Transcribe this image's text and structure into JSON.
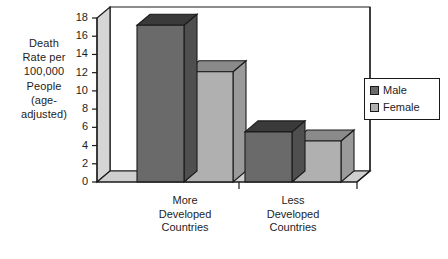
{
  "chart_data": {
    "type": "bar",
    "title": "",
    "subtitle": "",
    "xlabel": "",
    "ylabel": "Death Rate per 100,000 People (age-adjusted)",
    "ylabel_lines": [
      "Death",
      "Rate per",
      "100,000",
      "People",
      "(age-",
      "adjusted)"
    ],
    "categories": [
      "More Developed Countries",
      "Less Developed Countries"
    ],
    "category_lines": [
      [
        "More",
        "Developed",
        "Countries"
      ],
      [
        "Less",
        "Developed",
        "Countries"
      ]
    ],
    "series": [
      {
        "name": "Male",
        "values": [
          17.2,
          5.5
        ],
        "color": "#6a6a6a"
      },
      {
        "name": "Female",
        "values": [
          12.1,
          4.5
        ],
        "color": "#b0b0b0"
      }
    ],
    "ylim": [
      0,
      18
    ],
    "ytick_step": 2,
    "ytick_labels": [
      "18",
      "16",
      "14",
      "12",
      "10",
      "8",
      "6",
      "4",
      "2",
      "0"
    ],
    "ytick_values": [
      18,
      16,
      14,
      12,
      10,
      8,
      6,
      4,
      2,
      0
    ],
    "grid": false,
    "legend_position": "right",
    "legend_entries": [
      "Male",
      "Female"
    ],
    "projection": "3d",
    "colors": {
      "male_front": "#6a6a6a",
      "male_top": "#3a3a3a",
      "male_side": "#4f4f4f",
      "female_front": "#b0b0b0",
      "female_top": "#8a8a8a",
      "female_side": "#9a9a9a",
      "floor": "#cfcfcf",
      "left_wall": "#d5d5d5",
      "back_wall": "#ffffff",
      "outline": "#1a1a1a",
      "text": "#1d1d1d"
    }
  },
  "legend": {
    "items": [
      {
        "label": "Male",
        "color": "#6a6a6a"
      },
      {
        "label": "Female",
        "color": "#b0b0b0"
      }
    ]
  },
  "axis": {
    "y_title_lines": [
      "Death",
      "Rate per",
      "100,000",
      "People",
      "(age-",
      "adjusted)"
    ],
    "y_ticks": [
      "18",
      "16",
      "14",
      "12",
      "10",
      "8",
      "6",
      "4",
      "2",
      "0"
    ]
  }
}
